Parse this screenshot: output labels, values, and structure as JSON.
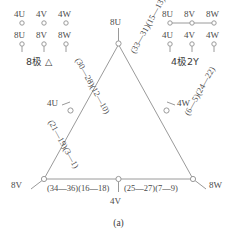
{
  "figure": {
    "caption": "(a)",
    "line_color": "#9a9a9a",
    "node_fill": "#ffffff",
    "text_color": "#4a4a4a"
  },
  "legend_left": {
    "title": "8极 △",
    "top_row": [
      "4U",
      "4V",
      "4W"
    ],
    "bottom_row": [
      "8U",
      "8V",
      "8W"
    ]
  },
  "legend_right": {
    "title": "4极2Y",
    "top_row": [
      "8U",
      "8V",
      "8W"
    ],
    "bottom_row": [
      "4U",
      "4V",
      "4W"
    ]
  },
  "terminals": {
    "apex": "8U",
    "bottom_left": "8V",
    "bottom_right": "8W",
    "left_mid": "4U",
    "right_mid": "4W",
    "bottom_mid": "4V"
  },
  "coil_groups": {
    "upper_left": "(30—28)(12—10)",
    "lower_left": "(21—19)(3—1)",
    "upper_right": "(33—31)(15—13)",
    "lower_right": "(6—5)(24—22)",
    "bottom_left": "(34—36)(16—18)",
    "bottom_right": "(25—27)(7—9)"
  }
}
